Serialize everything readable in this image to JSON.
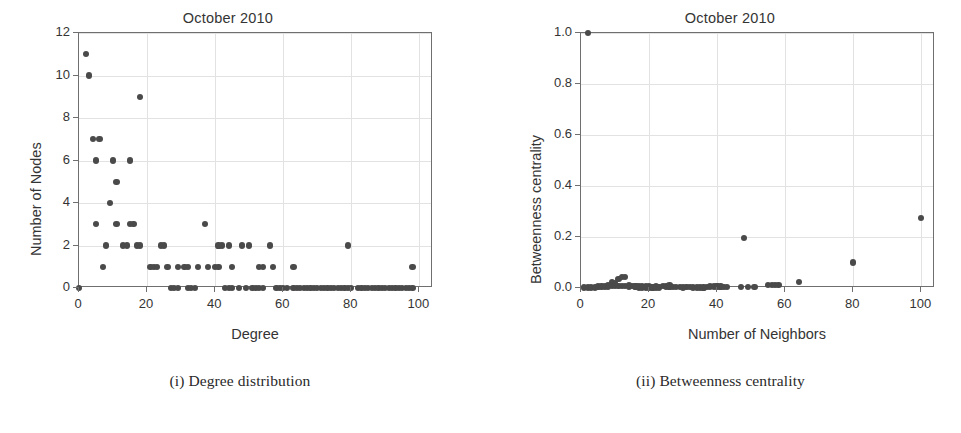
{
  "page": {
    "background_color": "#ffffff",
    "marker_color": "#4a4a4a",
    "axis_color": "#6f6f6f",
    "grid_color": "#e2e2e2",
    "text_color": "#343434"
  },
  "panels": [
    {
      "id": "degree-distribution",
      "caption": "(i) Degree distribution"
    },
    {
      "id": "betweenness-centrality",
      "caption": "(ii) Betweenness centrality"
    }
  ],
  "chart_data": [
    {
      "type": "scatter",
      "title": "October 2010",
      "xlabel": "Degree",
      "ylabel": "Number of Nodes",
      "xlim": [
        0,
        104
      ],
      "ylim": [
        0,
        12
      ],
      "xticks": [
        0,
        20,
        40,
        60,
        80,
        100
      ],
      "xticklabels": [
        "0",
        "20",
        "40",
        "60",
        "80",
        "100"
      ],
      "yticks": [
        0,
        2,
        4,
        6,
        8,
        10,
        12
      ],
      "yticklabels": [
        "0",
        "2",
        "4",
        "6",
        "8",
        "10",
        "12"
      ],
      "grid": true,
      "legend": null,
      "points": [
        [
          0,
          0
        ],
        [
          2,
          11
        ],
        [
          3,
          10
        ],
        [
          4,
          7
        ],
        [
          6,
          7
        ],
        [
          5,
          6
        ],
        [
          10,
          6
        ],
        [
          15,
          6
        ],
        [
          11,
          5
        ],
        [
          9,
          4
        ],
        [
          5,
          3
        ],
        [
          11,
          3
        ],
        [
          15,
          3
        ],
        [
          16,
          3
        ],
        [
          18,
          9
        ],
        [
          37,
          3
        ],
        [
          8,
          2
        ],
        [
          13,
          2
        ],
        [
          14,
          2
        ],
        [
          17,
          2
        ],
        [
          18,
          2
        ],
        [
          24,
          2
        ],
        [
          25,
          2
        ],
        [
          41,
          2
        ],
        [
          42,
          2
        ],
        [
          44,
          2
        ],
        [
          48,
          2
        ],
        [
          50,
          2
        ],
        [
          56,
          2
        ],
        [
          79,
          2
        ],
        [
          7,
          1
        ],
        [
          21,
          1
        ],
        [
          22,
          1
        ],
        [
          23,
          1
        ],
        [
          26,
          1
        ],
        [
          29,
          1
        ],
        [
          31,
          1
        ],
        [
          32,
          1
        ],
        [
          35,
          1
        ],
        [
          38,
          1
        ],
        [
          40,
          1
        ],
        [
          41,
          1
        ],
        [
          45,
          1
        ],
        [
          53,
          1
        ],
        [
          54,
          1
        ],
        [
          57,
          1
        ],
        [
          63,
          1
        ],
        [
          98,
          1
        ],
        [
          27,
          0
        ],
        [
          28,
          0
        ],
        [
          29,
          0
        ],
        [
          32,
          0
        ],
        [
          33,
          0
        ],
        [
          34,
          0
        ],
        [
          43,
          0
        ],
        [
          44,
          0
        ],
        [
          45,
          0
        ],
        [
          47,
          0
        ],
        [
          49,
          0
        ],
        [
          51,
          0
        ],
        [
          52,
          0
        ],
        [
          53,
          0
        ],
        [
          54,
          0
        ],
        [
          58,
          0
        ],
        [
          59,
          0
        ],
        [
          60,
          0
        ],
        [
          61,
          0
        ],
        [
          63,
          0
        ],
        [
          64,
          0
        ],
        [
          65,
          0
        ],
        [
          66,
          0
        ],
        [
          67,
          0
        ],
        [
          68,
          0
        ],
        [
          69,
          0
        ],
        [
          70,
          0
        ],
        [
          71,
          0
        ],
        [
          72,
          0
        ],
        [
          73,
          0
        ],
        [
          74,
          0
        ],
        [
          75,
          0
        ],
        [
          76,
          0
        ],
        [
          77,
          0
        ],
        [
          78,
          0
        ],
        [
          79,
          0
        ],
        [
          80,
          0
        ],
        [
          82,
          0
        ],
        [
          83,
          0
        ],
        [
          84,
          0
        ],
        [
          85,
          0
        ],
        [
          86,
          0
        ],
        [
          87,
          0
        ],
        [
          88,
          0
        ],
        [
          89,
          0
        ],
        [
          90,
          0
        ],
        [
          91,
          0
        ],
        [
          92,
          0
        ],
        [
          93,
          0
        ],
        [
          94,
          0
        ],
        [
          95,
          0
        ],
        [
          96,
          0
        ],
        [
          97,
          0
        ],
        [
          98,
          0
        ]
      ]
    },
    {
      "type": "scatter",
      "title": "October 2010",
      "xlabel": "Number of Neighbors",
      "ylabel": "Betweenness centrality",
      "xlim": [
        0,
        104
      ],
      "ylim": [
        0.0,
        1.0
      ],
      "xticks": [
        0,
        20,
        40,
        60,
        80,
        100
      ],
      "xticklabels": [
        "0",
        "20",
        "40",
        "60",
        "80",
        "100"
      ],
      "yticks": [
        0.0,
        0.2,
        0.4,
        0.6,
        0.8,
        1.0
      ],
      "yticklabels": [
        "0.0",
        "0.2",
        "0.4",
        "0.6",
        "0.8",
        "1.0"
      ],
      "grid": true,
      "legend": null,
      "points": [
        [
          2,
          1.0
        ],
        [
          100,
          0.275
        ],
        [
          48,
          0.197
        ],
        [
          80,
          0.1
        ],
        [
          64,
          0.024
        ],
        [
          11,
          0.034
        ],
        [
          12,
          0.044
        ],
        [
          13,
          0.044
        ],
        [
          9,
          0.022
        ],
        [
          10,
          0.019
        ],
        [
          56,
          0.012
        ],
        [
          57,
          0.012
        ],
        [
          58,
          0.012
        ],
        [
          55,
          0.011
        ],
        [
          1,
          0.002
        ],
        [
          2,
          0.002
        ],
        [
          3,
          0.003
        ],
        [
          4,
          0.004
        ],
        [
          5,
          0.004
        ],
        [
          5,
          0.006
        ],
        [
          6,
          0.005
        ],
        [
          6,
          0.008
        ],
        [
          7,
          0.005
        ],
        [
          7,
          0.009
        ],
        [
          8,
          0.006
        ],
        [
          8,
          0.01
        ],
        [
          9,
          0.007
        ],
        [
          10,
          0.008
        ],
        [
          11,
          0.009
        ],
        [
          12,
          0.009
        ],
        [
          13,
          0.008
        ],
        [
          14,
          0.006
        ],
        [
          14,
          0.01
        ],
        [
          15,
          0.007
        ],
        [
          16,
          0.006
        ],
        [
          16,
          0.009
        ],
        [
          17,
          0.006
        ],
        [
          18,
          0.007
        ],
        [
          19,
          0.006
        ],
        [
          20,
          0.006
        ],
        [
          21,
          0.005
        ],
        [
          22,
          0.006
        ],
        [
          23,
          0.005
        ],
        [
          24,
          0.009
        ],
        [
          25,
          0.009
        ],
        [
          25,
          0.005
        ],
        [
          26,
          0.006
        ],
        [
          26,
          0.01
        ],
        [
          27,
          0.005
        ],
        [
          28,
          0.004
        ],
        [
          29,
          0.004
        ],
        [
          31,
          0.003
        ],
        [
          32,
          0.003
        ],
        [
          37,
          0.005
        ],
        [
          38,
          0.006
        ],
        [
          39,
          0.006
        ],
        [
          40,
          0.006
        ],
        [
          40,
          0.009
        ],
        [
          41,
          0.006
        ],
        [
          42,
          0.005
        ],
        [
          43,
          0.005
        ],
        [
          47,
          0.005
        ],
        [
          49,
          0.005
        ],
        [
          51,
          0.005
        ],
        [
          3,
          0.001
        ],
        [
          4,
          0.001
        ],
        [
          17,
          0.002
        ],
        [
          18,
          0.002
        ],
        [
          19,
          0.002
        ],
        [
          20,
          0.002
        ],
        [
          21,
          0.002
        ],
        [
          22,
          0.002
        ],
        [
          23,
          0.002
        ],
        [
          30,
          0.002
        ],
        [
          33,
          0.002
        ],
        [
          34,
          0.002
        ],
        [
          35,
          0.002
        ],
        [
          36,
          0.002
        ]
      ]
    }
  ]
}
